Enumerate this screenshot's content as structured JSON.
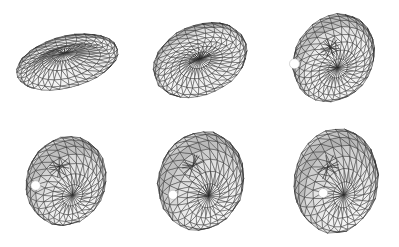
{
  "figure": {
    "description": "Six rendered 3D triangulated meshes arranged in a 2 by 3 grid, showing a biconcave discocyte progressively deforming into an elongated ellipsoid. Each mesh carries one white marker facet patch.",
    "background_color": "#ffffff",
    "mesh_edge_color": "#2b2b2b",
    "surface_fill_color": "#b8b8b8",
    "marker_color": "#ffffff",
    "rows": 2,
    "columns": 3,
    "width": 399,
    "height": 247
  },
  "panels": [
    {
      "id": "panel-1",
      "label": "",
      "row": 0,
      "column": 0,
      "origin_x": 0,
      "origin_y": 0,
      "shape": "biconcave-disc",
      "center_x": 67,
      "center_y": 62,
      "radius_x": 52,
      "radius_y": 50,
      "thickness": 0.3,
      "dimple": 0.62,
      "tilt_deg": -16,
      "elevation_deg": 62,
      "mesh_rings": 13,
      "mesh_sectors": 30,
      "marker_u": 0.68,
      "marker_v": 0.52,
      "marker_radius": 5.0,
      "seed": 101
    },
    {
      "id": "panel-2",
      "label": "",
      "row": 0,
      "column": 1,
      "origin_x": 133,
      "origin_y": 0,
      "shape": "biconcave-disc",
      "center_x": 67,
      "center_y": 60,
      "radius_x": 48,
      "radius_y": 52,
      "thickness": 0.42,
      "dimple": 0.48,
      "tilt_deg": -20,
      "elevation_deg": 52,
      "mesh_rings": 13,
      "mesh_sectors": 30,
      "marker_u": 0.6,
      "marker_v": 0.46,
      "marker_radius": 5.2,
      "seed": 202
    },
    {
      "id": "panel-3",
      "label": "",
      "row": 0,
      "column": 2,
      "origin_x": 266,
      "origin_y": 0,
      "shape": "ovoid",
      "center_x": 68,
      "center_y": 58,
      "radius_x": 42,
      "radius_y": 52,
      "thickness": 0.58,
      "dimple": 0.26,
      "tilt_deg": -24,
      "elevation_deg": 44,
      "mesh_rings": 13,
      "mesh_sectors": 28,
      "marker_u": 0.55,
      "marker_v": 0.36,
      "marker_radius": 5.0,
      "seed": 303
    },
    {
      "id": "panel-4",
      "label": "",
      "row": 1,
      "column": 0,
      "origin_x": 0,
      "origin_y": 123,
      "shape": "ellipsoid",
      "center_x": 66,
      "center_y": 58,
      "radius_x": 41,
      "radius_y": 48,
      "thickness": 0.7,
      "dimple": 0.1,
      "tilt_deg": -28,
      "elevation_deg": 36,
      "mesh_rings": 12,
      "mesh_sectors": 26,
      "marker_u": 0.5,
      "marker_v": 0.28,
      "marker_radius": 4.8,
      "seed": 404
    },
    {
      "id": "panel-5",
      "label": "",
      "row": 1,
      "column": 1,
      "origin_x": 133,
      "origin_y": 123,
      "shape": "ellipsoid",
      "center_x": 68,
      "center_y": 58,
      "radius_x": 44,
      "radius_y": 52,
      "thickness": 0.72,
      "dimple": 0.06,
      "tilt_deg": -32,
      "elevation_deg": 32,
      "mesh_rings": 12,
      "mesh_sectors": 26,
      "marker_u": 0.46,
      "marker_v": 0.22,
      "marker_radius": 4.6,
      "seed": 505
    },
    {
      "id": "panel-6",
      "label": "",
      "row": 1,
      "column": 2,
      "origin_x": 266,
      "origin_y": 123,
      "shape": "ellipsoid",
      "center_x": 70,
      "center_y": 58,
      "radius_x": 43,
      "radius_y": 54,
      "thickness": 0.74,
      "dimple": 0.04,
      "tilt_deg": -36,
      "elevation_deg": 28,
      "mesh_rings": 12,
      "mesh_sectors": 26,
      "marker_u": 0.4,
      "marker_v": 0.14,
      "marker_radius": 4.6,
      "seed": 606
    }
  ]
}
